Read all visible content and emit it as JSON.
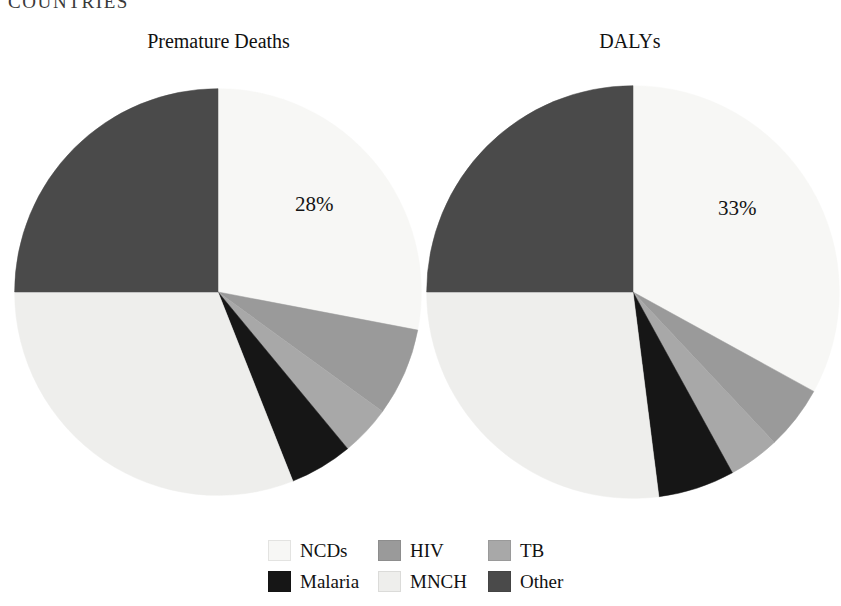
{
  "running_head": "COUNTRIES",
  "panels": [
    {
      "title": "Premature Deaths",
      "callout": "28%"
    },
    {
      "title": "DALYs",
      "callout": "33%"
    }
  ],
  "legend": {
    "items": [
      {
        "label": "NCDs",
        "color": "#f7f7f5"
      },
      {
        "label": "HIV",
        "color": "#9a9a9a"
      },
      {
        "label": "TB",
        "color": "#a8a8a8"
      },
      {
        "label": "Malaria",
        "color": "#161616"
      },
      {
        "label": "MNCH",
        "color": "#eeeeec"
      },
      {
        "label": "Other",
        "color": "#4a4a4a"
      }
    ]
  },
  "chart_data": [
    {
      "type": "pie",
      "title": "Premature Deaths",
      "categories": [
        "NCDs",
        "HIV",
        "TB",
        "Malaria",
        "MNCH",
        "Other"
      ],
      "values": [
        28,
        7,
        4,
        5,
        31,
        25
      ],
      "colors": [
        "#f7f7f5",
        "#9a9a9a",
        "#a8a8a8",
        "#161616",
        "#eeeeec",
        "#4a4a4a"
      ],
      "data_labels": {
        "NCDs": "28%"
      },
      "start_angle_deg": 0,
      "direction": "clockwise",
      "legend_position": "bottom",
      "grid": false
    },
    {
      "type": "pie",
      "title": "DALYs",
      "categories": [
        "NCDs",
        "HIV",
        "TB",
        "Malaria",
        "MNCH",
        "Other"
      ],
      "values": [
        33,
        5,
        4,
        6,
        27,
        25
      ],
      "colors": [
        "#f7f7f5",
        "#9a9a9a",
        "#a8a8a8",
        "#161616",
        "#eeeeec",
        "#4a4a4a"
      ],
      "data_labels": {
        "NCDs": "33%"
      },
      "start_angle_deg": 0,
      "direction": "clockwise",
      "legend_position": "bottom",
      "grid": false
    }
  ]
}
